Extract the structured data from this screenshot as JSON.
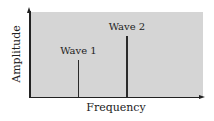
{
  "chart_data": {
    "type": "bar",
    "title": "",
    "xlabel": "Frequency",
    "ylabel": "Amplitude",
    "categories": [
      "Wave 1",
      "Wave 2"
    ],
    "values": [
      0.44,
      0.72
    ],
    "x_positions": [
      0.28,
      0.56
    ],
    "ylim": [
      0,
      1
    ],
    "xlim": [
      0,
      1
    ],
    "grid": false,
    "legend": null,
    "annotations": [
      "Wave 1",
      "Wave 2"
    ],
    "axis_ticks": false,
    "colors": {
      "plot_background": "#d5d5d5",
      "stem": "#2a2a2a",
      "axis": "#222222"
    }
  }
}
